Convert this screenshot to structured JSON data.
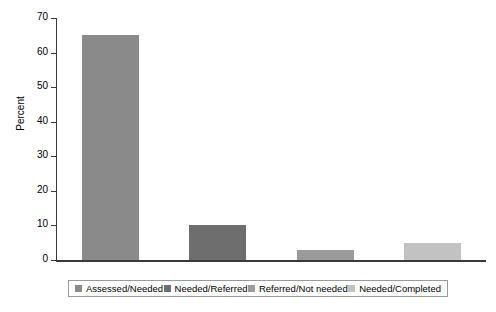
{
  "chart_data": {
    "type": "bar",
    "title": "",
    "xlabel": "",
    "ylabel": "Percent",
    "ylim": [
      0,
      70
    ],
    "yticks": [
      0,
      10,
      20,
      30,
      40,
      50,
      60,
      70
    ],
    "ytick_labels": [
      "0",
      "10",
      "20",
      "30",
      "40",
      "50",
      "60",
      "70"
    ],
    "grid": false,
    "legend_position": "bottom",
    "categories": [
      "Assessed/Needed",
      "Needed/Referred",
      "Referred/Not needed",
      "Needed/Completed"
    ],
    "values": [
      65,
      10,
      3,
      5
    ],
    "colors": [
      "#8a8a8a",
      "#6e6e6e",
      "#9b9b9b",
      "#c2c2c2"
    ],
    "bars": [
      {
        "label": "Assessed/Needed",
        "value": 65,
        "color": "#8a8a8a"
      },
      {
        "label": "Needed/Referred",
        "value": 10,
        "color": "#6e6e6e"
      },
      {
        "label": "Referred/Not needed",
        "value": 3,
        "color": "#9b9b9b"
      },
      {
        "label": "Needed/Completed",
        "value": 5,
        "color": "#c2c2c2"
      }
    ]
  },
  "legend": {
    "items": [
      {
        "label": "Assessed/Needed",
        "color": "#8a8a8a"
      },
      {
        "label": "Needed/Referred",
        "color": "#6e6e6e"
      },
      {
        "label": "Referred/Not needed",
        "color": "#9b9b9b"
      },
      {
        "label": "Needed/Completed",
        "color": "#c2c2c2"
      }
    ]
  },
  "axis": {
    "y_title": "Percent"
  }
}
